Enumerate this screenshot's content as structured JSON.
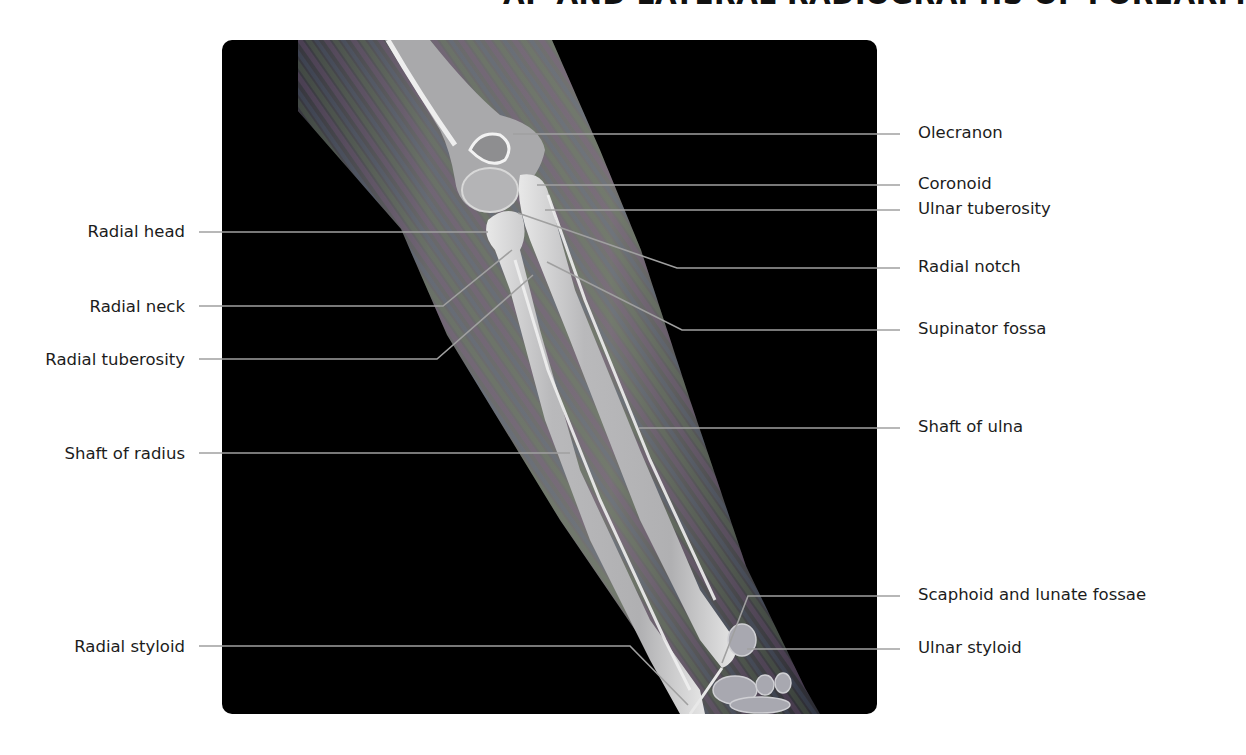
{
  "title": "AP AND LATERAL RADIOGRAPHS OF FOREARM",
  "figure": {
    "image": "lateral-forearm-radiograph",
    "background_color": "#000000",
    "leader_line_color": "#9a9a9a"
  },
  "labels_left": [
    {
      "text": "Radial head",
      "y": 232
    },
    {
      "text": "Radial neck",
      "y": 308
    },
    {
      "text": "Radial tuberosity",
      "y": 361
    },
    {
      "text": "Shaft of radius",
      "y": 455
    },
    {
      "text": "Radial styloid",
      "y": 648
    }
  ],
  "labels_right": [
    {
      "text": "Olecranon",
      "y": 134
    },
    {
      "text": "Coronoid",
      "y": 185
    },
    {
      "text": "Ulnar tuberosity",
      "y": 210
    },
    {
      "text": "Radial notch",
      "y": 268
    },
    {
      "text": "Supinator fossa",
      "y": 330
    },
    {
      "text": "Shaft of ulna",
      "y": 428
    },
    {
      "text": "Scaphoid and lunate fossae",
      "y": 596
    },
    {
      "text": "Ulnar styloid",
      "y": 649
    }
  ]
}
